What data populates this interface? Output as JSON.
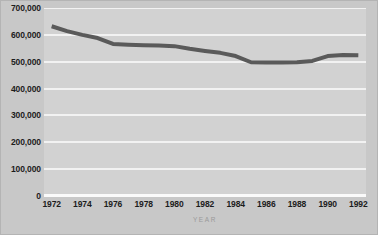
{
  "chart_data": {
    "type": "line",
    "title": "",
    "xlabel": "YEAR",
    "ylabel": "",
    "x": [
      1972,
      1973,
      1974,
      1975,
      1976,
      1977,
      1978,
      1979,
      1980,
      1981,
      1982,
      1983,
      1984,
      1985,
      1986,
      1987,
      1988,
      1989,
      1990,
      1991,
      1992
    ],
    "values": [
      632000,
      614000,
      600000,
      588000,
      566000,
      563000,
      561000,
      560000,
      558000,
      548000,
      540000,
      533000,
      521000,
      498000,
      497000,
      497000,
      498000,
      503000,
      521000,
      525000,
      524000
    ],
    "series": [
      {
        "name": "value",
        "values": [
          632000,
          614000,
          600000,
          588000,
          566000,
          563000,
          561000,
          560000,
          558000,
          548000,
          540000,
          533000,
          521000,
          498000,
          497000,
          497000,
          498000,
          503000,
          521000,
          525000,
          524000
        ]
      }
    ],
    "xlim": [
      1971.5,
      1992.5
    ],
    "ylim": [
      0,
      700000
    ],
    "ytick_values": [
      0,
      100000,
      200000,
      300000,
      400000,
      500000,
      600000,
      700000
    ],
    "ytick_labels": [
      "0",
      "100,000",
      "200,000",
      "300,000",
      "400,000",
      "500,000",
      "600,000",
      "700,000"
    ],
    "xtick_values": [
      1972,
      1974,
      1976,
      1978,
      1980,
      1982,
      1984,
      1986,
      1988,
      1990,
      1992
    ],
    "xtick_labels": [
      "1972",
      "1974",
      "1976",
      "1978",
      "1980",
      "1982",
      "1984",
      "1986",
      "1988",
      "1990",
      "1992"
    ],
    "grid": true,
    "grid_color": "#f2f2f2",
    "legend": false,
    "legend_position": "none",
    "line_color": "#5a5a5a",
    "line_width": 4,
    "plot_background": "#d2d2d2",
    "figure_background": "#c8c8c8",
    "label_color": "#1c1c1c",
    "axis_title_color": "#9a9a9a"
  }
}
